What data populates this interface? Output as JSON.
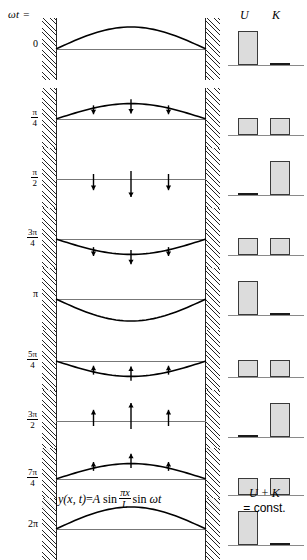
{
  "header": {
    "omega_t_label": "ωt =",
    "energy_headers": {
      "potential": "U",
      "kinetic": "K"
    }
  },
  "footer": {
    "formula": {
      "lhs": "y(x, t)",
      "equals": "=",
      "amplitude": "A",
      "sin1": "sin",
      "frac_num": "πx",
      "frac_den": "L",
      "sin2": "sin",
      "omega_t": "ωt",
      "full_text": "y(x, t) = A sin πx/L sin ωt"
    },
    "energy_note": {
      "line1": "U + K",
      "line2": "= const."
    }
  },
  "rows": [
    {
      "label_type": "plain",
      "label": "0",
      "label_num": "",
      "label_den": "",
      "phase_deg": 0,
      "amplitude": 1.0,
      "arrow_dir": "none",
      "arrow_len": 0,
      "U": 1.0,
      "K": 0.0
    },
    {
      "label_type": "fraction",
      "label": "π/4",
      "label_num": "π",
      "label_den": "4",
      "phase_deg": 45,
      "amplitude": 0.7,
      "arrow_dir": "down",
      "arrow_len": 0.55,
      "U": 0.5,
      "K": 0.5
    },
    {
      "label_type": "fraction",
      "label": "π/2",
      "label_num": "π",
      "label_den": "2",
      "phase_deg": 90,
      "amplitude": 0.0,
      "arrow_dir": "down",
      "arrow_len": 1.0,
      "U": 0.03,
      "K": 1.0
    },
    {
      "label_type": "fraction",
      "label": "3π/4",
      "label_num": "3π",
      "label_den": "4",
      "phase_deg": 135,
      "amplitude": -0.7,
      "arrow_dir": "down",
      "arrow_len": 0.55,
      "U": 0.5,
      "K": 0.5
    },
    {
      "label_type": "plain",
      "label": "π",
      "label_num": "",
      "label_den": "",
      "phase_deg": 180,
      "amplitude": -1.0,
      "arrow_dir": "none",
      "arrow_len": 0,
      "U": 1.0,
      "K": 0.03
    },
    {
      "label_type": "fraction",
      "label": "5π/4",
      "label_num": "5π",
      "label_den": "4",
      "phase_deg": 225,
      "amplitude": -0.7,
      "arrow_dir": "up",
      "arrow_len": 0.55,
      "U": 0.5,
      "K": 0.5
    },
    {
      "label_type": "fraction",
      "label": "3π/2",
      "label_num": "3π",
      "label_den": "2",
      "phase_deg": 270,
      "amplitude": 0.0,
      "arrow_dir": "up",
      "arrow_len": 1.0,
      "U": 0.03,
      "K": 1.0
    },
    {
      "label_type": "fraction",
      "label": "7π/4",
      "label_num": "7π",
      "label_den": "4",
      "phase_deg": 315,
      "amplitude": 0.7,
      "arrow_dir": "up",
      "arrow_len": 0.55,
      "U": 0.5,
      "K": 0.5
    },
    {
      "label_type": "plain",
      "label": "2π",
      "label_num": "",
      "label_den": "",
      "phase_deg": 360,
      "amplitude": 1.0,
      "arrow_dir": "none",
      "arrow_len": 0,
      "U": 1.0,
      "K": 0.03
    }
  ],
  "chart_data": {
    "type": "bar",
    "categories": [
      "0",
      "π/4",
      "π/2",
      "3π/4",
      "π",
      "5π/4",
      "3π/2",
      "7π/4",
      "2π"
    ],
    "xlabel": "ωt",
    "ylabel": "Energy",
    "ylim": [
      0,
      1
    ],
    "grid": false,
    "legend": [
      "U",
      "K"
    ],
    "legend_position": "top",
    "series": [
      {
        "name": "U",
        "values": [
          1.0,
          0.5,
          0.0,
          0.5,
          1.0,
          0.5,
          0.0,
          0.5,
          1.0
        ]
      },
      {
        "name": "K",
        "values": [
          0.0,
          0.5,
          1.0,
          0.5,
          0.0,
          0.5,
          1.0,
          0.5,
          0.0
        ]
      }
    ],
    "annotation": "U + K = const."
  },
  "geometry": {
    "row_tops": [
      18,
      88,
      148,
      208,
      268,
      330,
      390,
      448,
      498
    ],
    "row_height": 62,
    "bar_max_px": 34,
    "colors": {
      "bar_fill": "#dcdcdc",
      "bar_stroke": "#3a3a3a",
      "curve": "#000000",
      "axis": "#777777"
    }
  }
}
